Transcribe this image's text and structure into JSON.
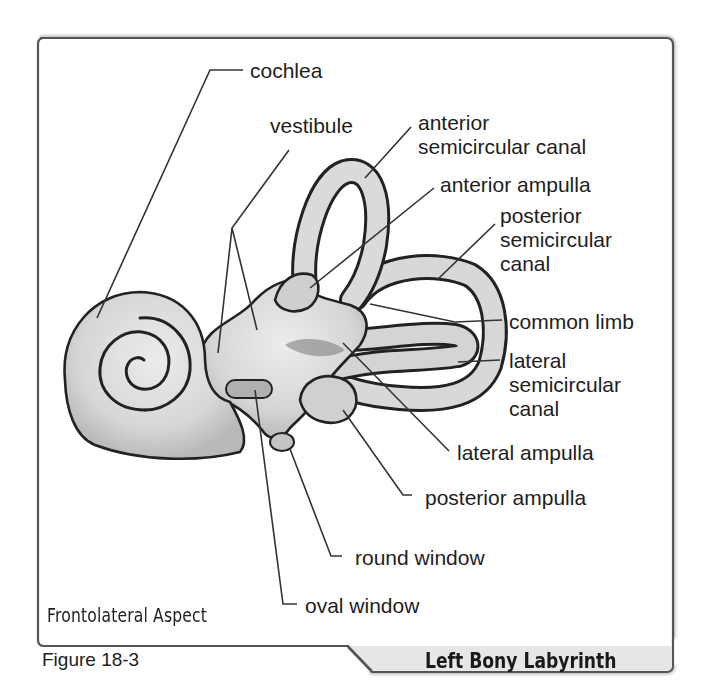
{
  "figure": {
    "number_label": "Figure 18-3",
    "title": "Left Bony Labyrinth",
    "view": "Frontolateral Aspect"
  },
  "labels": {
    "cochlea": "cochlea",
    "vestibule": "vestibule",
    "anterior_canal_1": "anterior",
    "anterior_canal_2": "semicircular canal",
    "anterior_ampulla": "anterior ampulla",
    "posterior_canal_1": "posterior",
    "posterior_canal_2": "semicircular",
    "posterior_canal_3": "canal",
    "common_limb": "common limb",
    "lateral_canal_1": "lateral",
    "lateral_canal_2": "semicircular",
    "lateral_canal_3": "canal",
    "lateral_ampulla": "lateral ampulla",
    "posterior_ampulla": "posterior ampulla",
    "round_window": "round window",
    "oval_window": "oval window"
  },
  "colors": {
    "frame_border": "#555555",
    "tab_fill": "#e6e6e6",
    "structure_fill": "#d9d9d9",
    "outline": "#222222"
  }
}
